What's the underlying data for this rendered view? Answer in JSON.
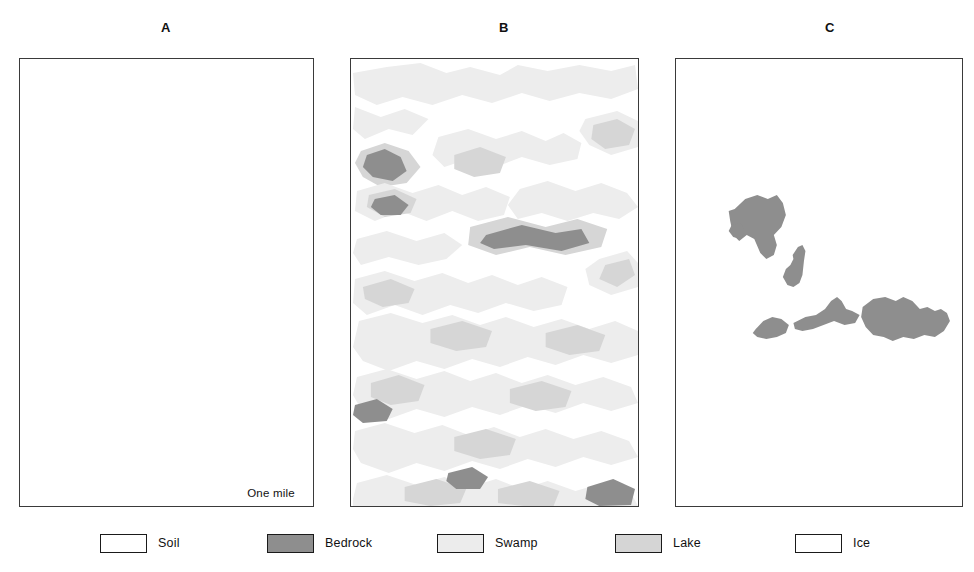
{
  "figure": {
    "caption_visible": false,
    "panels": [
      {
        "label": "A",
        "id": "panel-a",
        "description": "blank soil map",
        "features": []
      },
      {
        "label": "B",
        "id": "panel-b",
        "description": "dense mottled swamp, lake and bedrock map",
        "features": []
      },
      {
        "label": "C",
        "id": "panel-c",
        "description": "sparse bedrock outcrop map",
        "features": []
      }
    ]
  },
  "scalebar": {
    "label": "One mile"
  },
  "legend": {
    "items": [
      {
        "label": "Soil",
        "color": "#ffffff",
        "border": "#1a1a1a"
      },
      {
        "label": "Bedrock",
        "color": "#8e8e8e",
        "border": "#1a1a1a"
      },
      {
        "label": "Swamp",
        "color": "#ececec",
        "border": "#1a1a1a"
      },
      {
        "label": "Lake",
        "color": "#d5d5d5",
        "border": "#1a1a1a"
      },
      {
        "label": "Ice",
        "color": "#ffffff",
        "border": "#1a1a1a"
      }
    ]
  },
  "colors": {
    "soil": "#ffffff",
    "bedrock": "#8e8e8e",
    "swamp": "#ededed",
    "lake": "#d6d6d6",
    "ice": "#ffffff",
    "border": "#3a3a3a",
    "text": "#111111",
    "background": "#ffffff"
  },
  "chart_data": {
    "type": "map",
    "title": "",
    "panels": [
      {
        "label": "A",
        "categories_present": [
          "Soil"
        ],
        "coverage_percent": {
          "Soil": 100,
          "Swamp": 0,
          "Lake": 0,
          "Bedrock": 0
        },
        "polygons": []
      },
      {
        "label": "B",
        "categories_present": [
          "Soil",
          "Swamp",
          "Lake",
          "Bedrock"
        ],
        "coverage_percent": {
          "Soil": 52,
          "Swamp": 26,
          "Lake": 16,
          "Bedrock": 6
        },
        "polygons": [
          {
            "class": "swamp",
            "points": "36,8 70,4 96,14 120,8 150,16 168,6 198,12 230,6 262,12 286,6 289,30 262,40 230,34 200,42 172,34 142,44 112,36 82,46 52,38 26,46 4,36 2,14"
          },
          {
            "class": "swamp",
            "points": "4,48 30,58 54,50 78,60 62,76 38,70 14,80 2,70"
          },
          {
            "class": "lake",
            "points": "10,92 34,84 58,92 70,108 56,124 30,128 12,118 4,104"
          },
          {
            "class": "bedrock",
            "points": "16,96 34,90 50,98 56,112 42,122 22,118 12,108"
          },
          {
            "class": "swamp",
            "points": "88,78 118,70 146,80 172,72 196,82 214,74 232,84 228,100 200,106 172,98 146,108 118,100 94,108 82,96"
          },
          {
            "class": "lake",
            "points": "104,96 130,88 156,98 150,114 124,118 104,110"
          },
          {
            "class": "swamp",
            "points": "236,60 268,52 289,62 289,88 262,96 240,86 230,72"
          },
          {
            "class": "lake",
            "points": "244,66 268,60 286,70 280,86 256,90 242,80"
          },
          {
            "class": "swamp",
            "points": "6,132 34,124 62,134 88,126 112,136 136,128 160,138 154,156 128,162 102,152 76,162 50,152 24,162 4,152"
          },
          {
            "class": "lake",
            "points": "18,136 44,130 66,140 60,154 34,158 16,148"
          },
          {
            "class": "bedrock",
            "points": "24,140 44,136 58,146 50,156 30,156 20,148"
          },
          {
            "class": "swamp",
            "points": "170,130 198,122 226,132 252,124 278,134 289,148 270,160 244,154 218,162 192,154 168,160 158,146"
          },
          {
            "class": "lake",
            "points": "120,168 158,158 196,168 228,160 258,170 252,188 216,196 180,188 146,196 118,186"
          },
          {
            "class": "bedrock",
            "points": "136,176 172,166 206,174 232,170 240,184 212,192 176,186 144,190 130,184"
          },
          {
            "class": "swamp",
            "points": "6,180 36,172 66,182 94,174 112,186 96,200 68,206 38,198 10,206 2,194"
          },
          {
            "class": "swamp",
            "points": "250,200 278,192 289,204 289,228 262,236 240,226 236,210"
          },
          {
            "class": "lake",
            "points": "256,206 280,200 286,216 268,228 250,220"
          },
          {
            "class": "swamp",
            "points": "4,220 34,212 64,222 92,214 118,224 142,216 168,226 192,218 218,228 212,246 184,252 156,244 128,254 100,246 72,256 44,246 16,256 2,244"
          },
          {
            "class": "lake",
            "points": "12,228 40,220 64,230 58,244 32,248 14,240"
          },
          {
            "class": "swamp",
            "points": "8,262 40,254 72,264 102,256 130,266 156,258 184,268 212,260 240,270 266,262 289,272 289,296 262,304 234,296 206,306 178,298 150,308 122,300 94,310 66,302 38,312 12,302 2,288"
          },
          {
            "class": "lake",
            "points": "80,270 112,262 142,272 136,288 106,292 80,284"
          },
          {
            "class": "lake",
            "points": "196,274 228,266 256,276 250,292 220,296 196,288"
          },
          {
            "class": "swamp",
            "points": "6,318 36,310 66,320 94,312 120,322 146,314 172,324 198,316 226,326 254,318 282,328 289,344 262,352 234,344 206,354 178,346 150,356 122,348 94,358 66,350 38,360 10,350 2,336"
          },
          {
            "class": "lake",
            "points": "20,324 48,316 74,326 68,342 40,346 20,338"
          },
          {
            "class": "lake",
            "points": "160,330 192,322 222,332 216,348 186,352 160,344"
          },
          {
            "class": "bedrock",
            "points": "4,346 26,340 42,350 36,362 12,364 2,356"
          },
          {
            "class": "swamp",
            "points": "4,372 34,364 64,374 92,366 118,376 144,368 170,378 196,370 224,380 252,372 280,382 289,398 262,406 234,398 206,408 178,400 150,410 122,402 94,412 66,404 38,414 10,404 2,390"
          },
          {
            "class": "lake",
            "points": "104,378 136,370 166,380 160,396 130,400 104,392"
          },
          {
            "class": "swamp",
            "points": "6,424 36,416 66,426 94,418 120,428 146,420 172,430 198,422 226,432 254,424 282,434 289,447 2,447 2,440"
          },
          {
            "class": "lake",
            "points": "54,428 86,420 116,430 110,444 80,447 54,442"
          },
          {
            "class": "lake",
            "points": "148,430 180,422 210,432 204,447 174,447 148,444"
          },
          {
            "class": "bedrock",
            "points": "238,428 264,420 286,430 282,446 250,447 236,440"
          },
          {
            "class": "bedrock",
            "points": "98,414 122,408 138,418 130,430 106,430 96,422"
          }
        ]
      },
      {
        "label": "C",
        "categories_present": [
          "Soil",
          "Bedrock"
        ],
        "coverage_percent": {
          "Soil": 94,
          "Bedrock": 6,
          "Swamp": 0,
          "Lake": 0
        },
        "polygons": [
          {
            "class": "bedrock",
            "points": "78,150 92,140 108,136 122,140 134,136 142,144 146,156 140,168 130,176 134,186 130,196 120,200 112,194 104,180 94,176 84,182 76,176 72,162 70,152"
          },
          {
            "class": "bedrock",
            "points": "74,166 86,164 92,172 86,180 76,178 70,172"
          },
          {
            "class": "bedrock",
            "points": "155,196 162,188 168,186 172,192 170,202 168,216 164,224 156,228 148,226 142,218 146,210 152,206 156,200"
          },
          {
            "class": "bedrock",
            "points": "106,270 116,262 128,258 140,260 150,266 146,274 134,278 120,280 108,278 102,274"
          },
          {
            "class": "bedrock",
            "points": "156,264 172,258 186,256 198,250 206,242 214,238 220,242 226,250 234,252 244,256 238,264 224,266 210,262 196,266 182,270 168,272 158,270"
          },
          {
            "class": "bedrock",
            "points": "248,248 262,240 278,238 292,242 302,238 314,242 324,250 334,248 344,252 352,250 360,254 364,262 356,272 344,278 330,276 316,280 302,278 288,282 276,278 262,276 252,268 246,258"
          }
        ]
      }
    ],
    "legend_entries": [
      "Soil",
      "Bedrock",
      "Swamp",
      "Lake",
      "Ice"
    ],
    "scalebar_label": "One mile"
  }
}
